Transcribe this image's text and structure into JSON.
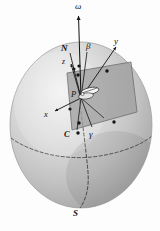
{
  "figure": {
    "background_color": "#fdfdfd",
    "sphere": {
      "center_x": 81,
      "center_y": 125,
      "radius_x": 71,
      "radius_y": 83,
      "fill_light": "#efefef",
      "fill_mid": "#c9c9c9",
      "fill_dark": "#a9a9a9",
      "outline_color": "#8f8f8f"
    },
    "plane": {
      "fill": "#8f8f8f",
      "opacity": 0.72,
      "edge_color": "#5a5a5a",
      "points": "67,73 131,62 137,112 72,130"
    },
    "equator": {
      "stroke": "#4a4a4a",
      "dash": "3 2"
    },
    "meridian": {
      "stroke": "#3a3a3a",
      "dash": "3 2"
    }
  },
  "labels": {
    "omega": "ω",
    "north_pole": "N",
    "beta": "β",
    "z_axis": "z",
    "y_axis": "y",
    "x_axis": "x",
    "point_p": "P",
    "point_c": "C",
    "gamma": "γ",
    "south_pole": "S"
  },
  "label_positions": {
    "omega": {
      "x": 75,
      "y": 3
    },
    "north_pole": {
      "x": 62,
      "y": 45
    },
    "beta": {
      "x": 86,
      "y": 43
    },
    "z_axis": {
      "x": 63,
      "y": 59
    },
    "y_axis": {
      "x": 114,
      "y": 38
    },
    "x_axis": {
      "x": 45,
      "y": 111
    },
    "point_p": {
      "x": 72,
      "y": 91
    },
    "point_c": {
      "x": 65,
      "y": 131
    },
    "gamma": {
      "x": 89,
      "y": 131
    },
    "south_pole": {
      "x": 74,
      "y": 210
    }
  },
  "markers": [
    {
      "name": "plane-corner-upper-left",
      "x": 78,
      "y": 75
    },
    {
      "name": "plane-corner-upper-right",
      "x": 107,
      "y": 71
    },
    {
      "name": "plane-corner-lower-right",
      "x": 114,
      "y": 122
    },
    {
      "name": "plane-corner-lower-left",
      "x": 78,
      "y": 123
    },
    {
      "name": "axis-x-tip",
      "x": 70,
      "y": 109
    },
    {
      "name": "axis-node-n",
      "x": 79,
      "y": 65
    },
    {
      "name": "point-c-dot",
      "x": 78,
      "y": 133
    },
    {
      "name": "axis-node-z",
      "x": 75,
      "y": 68
    }
  ],
  "vectors": [
    {
      "name": "omega-axis",
      "x1": 81,
      "y1": 98,
      "x2": 78,
      "y2": 13,
      "arrow": true
    },
    {
      "name": "n-direction",
      "x1": 81,
      "y1": 98,
      "x2": 70,
      "y2": 52,
      "arrow": false
    },
    {
      "name": "beta-ray",
      "x1": 81,
      "y1": 98,
      "x2": 88,
      "y2": 50,
      "arrow": false
    },
    {
      "name": "y-axis",
      "x1": 81,
      "y1": 98,
      "x2": 117,
      "y2": 45,
      "arrow": true
    },
    {
      "name": "x-axis",
      "x1": 81,
      "y1": 98,
      "x2": 53,
      "y2": 112,
      "arrow": true
    },
    {
      "name": "z-axis",
      "x1": 81,
      "y1": 98,
      "x2": 70,
      "y2": 62,
      "arrow": true
    },
    {
      "name": "gamma-ray",
      "x1": 81,
      "y1": 98,
      "x2": 92,
      "y2": 128,
      "arrow": false
    },
    {
      "name": "c-ray",
      "x1": 81,
      "y1": 98,
      "x2": 76,
      "y2": 130,
      "arrow": false
    }
  ]
}
